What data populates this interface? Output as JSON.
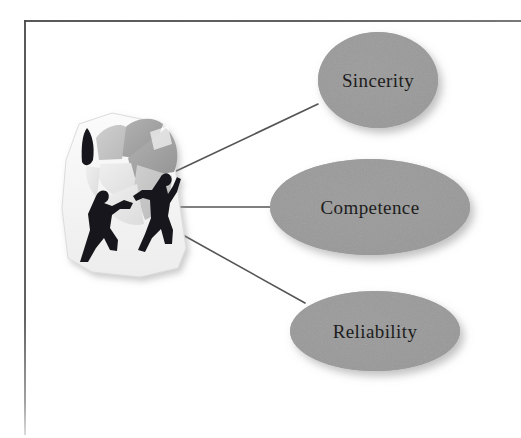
{
  "diagram": {
    "type": "node-link concept diagram",
    "source_node": {
      "name": "teamwork-clipart",
      "description": "Clip-art of two human silhouettes assembling a large puzzle / pie shape",
      "figure_count": 2
    },
    "nodes": [
      {
        "id": "sincerity",
        "label": "Sincerity",
        "shape": "ellipse",
        "cx": 378,
        "cy": 80,
        "rx": 60,
        "ry": 48,
        "fill": "#989898"
      },
      {
        "id": "competence",
        "label": "Competence",
        "shape": "ellipse",
        "cx": 370,
        "cy": 207,
        "rx": 100,
        "ry": 48,
        "fill": "#989898"
      },
      {
        "id": "reliability",
        "label": "Reliability",
        "shape": "ellipse",
        "cx": 375,
        "cy": 331,
        "rx": 85,
        "ry": 40,
        "fill": "#989898"
      }
    ],
    "edges": [
      {
        "from": "teamwork-clipart",
        "to": "sincerity",
        "x1": 172,
        "y1": 173,
        "x2": 318,
        "y2": 104
      },
      {
        "from": "teamwork-clipart",
        "to": "competence",
        "x1": 176,
        "y1": 207,
        "x2": 272,
        "y2": 207
      },
      {
        "from": "teamwork-clipart",
        "to": "reliability",
        "x1": 183,
        "y1": 235,
        "x2": 305,
        "y2": 303
      }
    ],
    "edge_color": "#555555",
    "frame_color": "#4a4a4a",
    "background": "#ffffff"
  }
}
